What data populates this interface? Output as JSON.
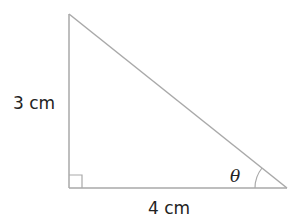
{
  "figure": {
    "type": "right-triangle",
    "vertical_side_label": "3 cm",
    "horizontal_side_label": "4 cm",
    "angle_label": "θ",
    "right_angle_marker": true,
    "vertices": {
      "top": [
        69,
        14
      ],
      "right_angle": [
        69,
        188
      ],
      "angle_theta": [
        287,
        188
      ]
    },
    "colors": {
      "stroke": "#a9a9a9",
      "text": "#222222"
    }
  }
}
